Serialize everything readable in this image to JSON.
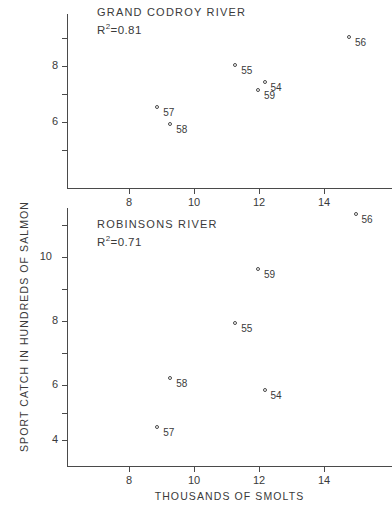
{
  "chart_data": [
    {
      "type": "scatter",
      "title": "GRAND CODROY RIVER",
      "annotation": "R² = 0.81",
      "r_squared": 0.81,
      "xlabel": "THOUSANDS OF SMOLTS",
      "ylabel": "SPORT CATCH IN HUNDREDS OF SALMON",
      "xlim": [
        6.4,
        15.8
      ],
      "ylim": [
        4.4,
        9.6
      ],
      "xticks": [
        8,
        10,
        12,
        14
      ],
      "yticks": [
        6,
        8
      ],
      "yminorticks": [
        5,
        7,
        9
      ],
      "grid": false,
      "legend": "none",
      "points": [
        {
          "label": "56",
          "x": 14.8,
          "y": 9.0
        },
        {
          "label": "55",
          "x": 11.3,
          "y": 8.0
        },
        {
          "label": "54",
          "x": 12.2,
          "y": 7.4
        },
        {
          "label": "59",
          "x": 12.0,
          "y": 7.1
        },
        {
          "label": "57",
          "x": 8.9,
          "y": 6.5
        },
        {
          "label": "58",
          "x": 9.3,
          "y": 5.9
        }
      ]
    },
    {
      "type": "scatter",
      "title": "ROBINSONS RIVER",
      "annotation": "R² = 0.71",
      "r_squared": 0.71,
      "xlabel": "THOUSANDS OF SMOLTS",
      "ylabel": "SPORT CATCH IN HUNDREDS OF SALMON",
      "xlim": [
        6.4,
        15.8
      ],
      "ylim": [
        3.4,
        11.8
      ],
      "xticks": [
        8,
        10,
        12,
        14
      ],
      "yticks": [
        4,
        6,
        8,
        10
      ],
      "yminorticks": [
        5,
        7,
        9,
        11
      ],
      "grid": false,
      "legend": "none",
      "points": [
        {
          "label": "56",
          "x": 15.0,
          "y": 11.3
        },
        {
          "label": "59",
          "x": 12.0,
          "y": 9.6
        },
        {
          "label": "55",
          "x": 11.3,
          "y": 7.9
        },
        {
          "label": "58",
          "x": 9.3,
          "y": 6.2
        },
        {
          "label": "54",
          "x": 12.2,
          "y": 5.8
        },
        {
          "label": "57",
          "x": 8.9,
          "y": 4.65
        }
      ]
    }
  ],
  "figure": {
    "xlabel": "THOUSANDS OF SMOLTS",
    "ylabel": "SPORT CATCH IN HUNDREDS OF SALMON",
    "axis_color": "#4a4a4a",
    "text_color": "#3a3a3a",
    "background": "#ffffff"
  },
  "panels": {
    "top": {
      "title": "GRAND CODROY RIVER",
      "r2_prefix": "R",
      "r2_sup": "2",
      "r2_value": "=0.81"
    },
    "bottom": {
      "title": "ROBINSONS RIVER",
      "r2_prefix": "R",
      "r2_sup": "2",
      "r2_value": "=0.71"
    }
  }
}
